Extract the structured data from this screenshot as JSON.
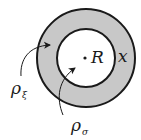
{
  "diagram": {
    "type": "concentric-circles",
    "colors": {
      "ring_fill": "#c8c8c8",
      "inner_fill": "#ffffff",
      "stroke": "#1a1a1a"
    },
    "outer_circle": {
      "cx": 86,
      "cy": 58,
      "r": 49
    },
    "inner_circle": {
      "cx": 86,
      "cy": 58,
      "r": 29
    },
    "center_point": {
      "cx": 85,
      "cy": 58
    },
    "labels": {
      "center": "R",
      "ring": "x",
      "rho_xi": {
        "base": "ρ",
        "sub": "ξ"
      },
      "rho_sigma": {
        "base": "ρ",
        "sub": "σ"
      }
    },
    "arrows": [
      {
        "name": "rho-xi-arrow",
        "points_to": "ring"
      },
      {
        "name": "rho-sigma-arrow",
        "points_to": "inner-region"
      }
    ]
  }
}
